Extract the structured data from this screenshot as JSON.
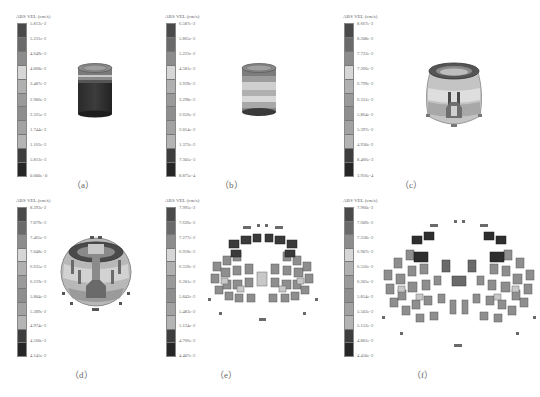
{
  "figure": {
    "legend_title": "ABS VEL (cm/s)",
    "colorbar_shades": [
      "#4a4a4a",
      "#6a6a6a",
      "#8c8c8c",
      "#d6d6d6",
      "#b0b0b0",
      "#9a9a9a",
      "#8e8e8e",
      "#a2a2a2",
      "#b4b4b4",
      "#3e3e3e",
      "#262626"
    ],
    "panels": [
      {
        "id": "a",
        "caption": "（a）",
        "model": "cylinder-intact",
        "ticks": [
          "5.812e-2",
          "5.231e-2",
          "4.649e-2",
          "4.068e-2",
          "3.487e-2",
          "2.906e-2",
          "2.325e-2",
          "1.744e-2",
          "1.162e-2",
          "5.812e-3",
          "0.000e+0"
        ]
      },
      {
        "id": "b",
        "caption": "（b）",
        "model": "cylinder-banded",
        "ticks": [
          "6.587e-2",
          "5.865e-2",
          "5.223e-2",
          "4.581e-2",
          "3.939e-2",
          "3.298e-2",
          "2.656e-2",
          "2.014e-2",
          "1.372e-2",
          "7.305e-3",
          "8.875e-4"
        ]
      },
      {
        "id": "c",
        "caption": "（c）",
        "model": "bulged-cylinder",
        "ticks": [
          "8.667e-2",
          "8.208e-2",
          "7.733e-2",
          "7.266e-2",
          "6.799e-2",
          "6.331e-2",
          "5.864e-2",
          "5.397e-2",
          "4.930e-2",
          "8.466e-3",
          "3.956e-4"
        ]
      },
      {
        "id": "d",
        "caption": "（d）",
        "model": "fragmenting-sphere",
        "ticks": [
          "8.293e-2",
          "7.879e-2",
          "7.465e-2",
          "7.048e-2",
          "6.635e-2",
          "6.219e-2",
          "5.804e-2",
          "5.389e-2",
          "4.974e-2",
          "4.560e-2",
          "4.145e-2"
        ]
      },
      {
        "id": "e",
        "caption": "（e）",
        "model": "fragment-cloud",
        "ticks": [
          "7.995e-2",
          "7.636e-2",
          "7.277e-2",
          "6.918e-2",
          "6.559e-2",
          "6.201e-2",
          "5.842e-2",
          "5.483e-2",
          "5.124e-2",
          "4.766e-2",
          "4.407e-2"
        ]
      },
      {
        "id": "f",
        "caption": "（f）",
        "model": "expanded-fragment-cloud",
        "ticks": [
          "7.960e-2",
          "7.609e-2",
          "7.258e-2",
          "6.907e-2",
          "6.556e-2",
          "6.205e-2",
          "5.854e-2",
          "5.503e-2",
          "5.152e-2",
          "4.801e-2",
          "4.450e-2"
        ]
      }
    ]
  }
}
